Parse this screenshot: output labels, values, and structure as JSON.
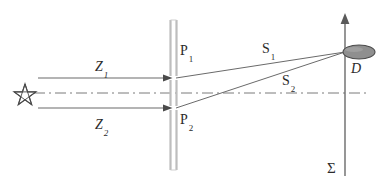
{
  "figure": {
    "kind": "optics-diagram",
    "width": 385,
    "height": 186,
    "background_color": "#ffffff",
    "line_color": "#555555",
    "plate_color": "#b8b8b8",
    "detector_fill": "#8c8c8c",
    "detector_stroke": "#4a4a4a",
    "axis_color": "#6b6b6b",
    "text_color": "#2b2b2b"
  },
  "labels": {
    "z1": {
      "base": "Z",
      "sub": "1"
    },
    "z2": {
      "base": "Z",
      "sub": "2"
    },
    "p1": {
      "base": "P",
      "sub": "1"
    },
    "p2": {
      "base": "P",
      "sub": "2"
    },
    "s1": {
      "base": "S",
      "sub": "1"
    },
    "s2": {
      "base": "S",
      "sub": "2"
    },
    "d": {
      "base": "D",
      "sub": ""
    },
    "sigma": {
      "base": "Σ",
      "sub": ""
    }
  },
  "elements": {
    "source": {
      "name": "star-source",
      "shape": "five-pointed-star",
      "cx": 25,
      "cy": 95,
      "r": 11
    },
    "plate": {
      "name": "aperture-plate",
      "x": 170,
      "y_top": 20,
      "y_bottom": 170,
      "thickness": 7
    },
    "slit_1": {
      "name": "slit-p1",
      "x": 173,
      "y": 78
    },
    "slit_2": {
      "name": "slit-p2",
      "x": 173,
      "y": 108
    },
    "beam_1": {
      "name": "incident-beam-z1",
      "x1": 38,
      "y1": 78,
      "x2": 173,
      "y2": 78
    },
    "beam_2": {
      "name": "incident-beam-z2",
      "x1": 38,
      "y1": 108,
      "x2": 173,
      "y2": 108
    },
    "optical_axis": {
      "name": "optical-axis",
      "x1": 34,
      "y1": 93,
      "x2": 367,
      "y2": 93,
      "style": "dash-dot"
    },
    "ray_1": {
      "name": "diffracted-ray-s1",
      "x1": 175,
      "y1": 78,
      "x2": 345,
      "y2": 52
    },
    "ray_2": {
      "name": "diffracted-ray-s2",
      "x1": 175,
      "y1": 108,
      "x2": 345,
      "y2": 52
    },
    "screen_axis": {
      "name": "screen-axis-sigma",
      "x": 345,
      "y_top": 15,
      "y_bottom": 176,
      "arrow": "up"
    },
    "detector": {
      "name": "detector-d",
      "cx": 359,
      "cy": 52,
      "rx": 16,
      "ry": 7
    }
  }
}
